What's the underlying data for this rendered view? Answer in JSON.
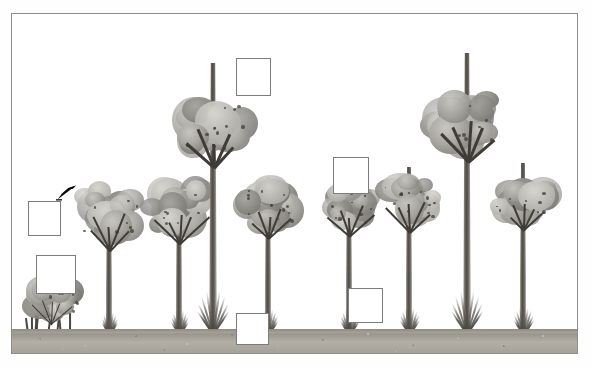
{
  "document": {
    "title": "Tree Growth Stages Labeling Exercise",
    "illustration_alt": "Grayscale botanical illustration of a tree growth sequence: a low multi-stemmed shrub followed by eight progressively taller broadleaf trees with flared buttressed trunks, all rooted on a speckled grey soil strip."
  },
  "frame": {
    "border_color": "#8e8e8e",
    "background_color": "#ffffff"
  },
  "ground": {
    "label": "soil strip",
    "color": "#a9a49c"
  },
  "palette": {
    "canopy_mid": "#a9a7a2",
    "canopy_light": "#d8d6d1",
    "canopy_dark": "#6e6c68",
    "trunk_dark": "#4e4a44",
    "trunk_light": "#d7d3cd",
    "ground": "#a9a49c",
    "box_border": "#7c7c7c",
    "box_fill": "#ffffff",
    "cursor": "#000000"
  },
  "answer_boxes": [
    {
      "id": "box-1",
      "label": "",
      "placeholder": "",
      "x": 28,
      "y": 201,
      "w": 33,
      "h": 35
    },
    {
      "id": "box-2",
      "label": "",
      "placeholder": "",
      "x": 36,
      "y": 255,
      "w": 40,
      "h": 39
    },
    {
      "id": "box-3",
      "label": "",
      "placeholder": "",
      "x": 236,
      "y": 58,
      "w": 35,
      "h": 38
    },
    {
      "id": "box-4",
      "label": "",
      "placeholder": "",
      "x": 333,
      "y": 157,
      "w": 36,
      "h": 37
    },
    {
      "id": "box-5",
      "label": "",
      "placeholder": "",
      "x": 236,
      "y": 313,
      "w": 33,
      "h": 32
    },
    {
      "id": "box-6",
      "label": "",
      "placeholder": "",
      "x": 348,
      "y": 288,
      "w": 35,
      "h": 35
    }
  ],
  "cursor": {
    "name": "mouse-pointer",
    "x": 56,
    "y": 184,
    "direction": "up-right"
  },
  "plants": [
    {
      "id": "shrub-1",
      "type": "shrub",
      "stage": "seedling thicket",
      "center_x": 50,
      "trunk_height": 24,
      "trunk_width": 2,
      "canopy_w": 78,
      "canopy_h": 52,
      "canopy_top_y": 262
    },
    {
      "id": "tree-1",
      "type": "tree",
      "stage": "sapling",
      "center_x": 108,
      "trunk_height": 138,
      "trunk_width": 7,
      "canopy_w": 84,
      "canopy_h": 74,
      "canopy_top_y": 104
    },
    {
      "id": "tree-2",
      "type": "tree",
      "stage": "pole",
      "center_x": 178,
      "trunk_height": 150,
      "trunk_width": 7,
      "canopy_w": 82,
      "canopy_h": 72,
      "canopy_top_y": 104
    },
    {
      "id": "tree-3",
      "type": "tree",
      "stage": "emergent",
      "center_x": 212,
      "trunk_height": 272,
      "trunk_width": 8,
      "canopy_w": 92,
      "canopy_h": 80,
      "canopy_top_y": 24
    },
    {
      "id": "tree-4",
      "type": "tree",
      "stage": "pole",
      "center_x": 267,
      "trunk_height": 158,
      "trunk_width": 7,
      "canopy_w": 78,
      "canopy_h": 66,
      "canopy_top_y": 116
    },
    {
      "id": "tree-5",
      "type": "tree",
      "stage": "pole",
      "center_x": 348,
      "trunk_height": 162,
      "trunk_width": 7,
      "canopy_w": 66,
      "canopy_h": 60,
      "canopy_top_y": 118
    },
    {
      "id": "tree-6",
      "type": "tree",
      "stage": "mature",
      "center_x": 408,
      "trunk_height": 168,
      "trunk_width": 7,
      "canopy_w": 74,
      "canopy_h": 64,
      "canopy_top_y": 114
    },
    {
      "id": "tree-7",
      "type": "tree",
      "stage": "emergent",
      "center_x": 466,
      "trunk_height": 282,
      "trunk_width": 8,
      "canopy_w": 96,
      "canopy_h": 76,
      "canopy_top_y": 28
    },
    {
      "id": "tree-8",
      "type": "tree",
      "stage": "mature",
      "center_x": 522,
      "trunk_height": 172,
      "trunk_width": 7,
      "canopy_w": 80,
      "canopy_h": 62,
      "canopy_top_y": 114
    }
  ]
}
